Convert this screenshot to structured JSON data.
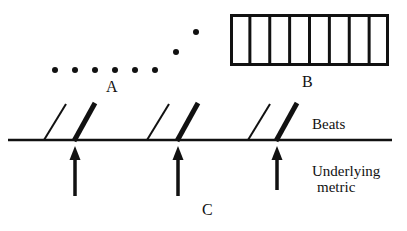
{
  "figure": {
    "width": 407,
    "height": 231,
    "background_color": "#ffffff",
    "ink_color": "#111111"
  },
  "labels": {
    "a": "A",
    "b": "B",
    "c": "C",
    "beats": "Beats",
    "underlying_metric_line1": "Underlying",
    "underlying_metric_line2": "metric"
  },
  "dot_row": {
    "name": "attack-point-dots",
    "count": 8,
    "radius": 3,
    "points": [
      {
        "x": 55,
        "y": 70
      },
      {
        "x": 75,
        "y": 70
      },
      {
        "x": 95,
        "y": 70
      },
      {
        "x": 115,
        "y": 70
      },
      {
        "x": 135,
        "y": 70
      },
      {
        "x": 155,
        "y": 70
      },
      {
        "x": 176,
        "y": 52
      },
      {
        "x": 196,
        "y": 32
      }
    ]
  },
  "grid_box": {
    "name": "eight-cell-grid",
    "x": 230,
    "y": 14,
    "width": 159,
    "height": 52,
    "cells": 8,
    "outer_stroke": 3,
    "inner_stroke": 3
  },
  "beat_line": {
    "name": "beats-baseline",
    "x1": 8,
    "x2": 392,
    "y": 140,
    "stroke": 2.5
  },
  "beat_slashes": [
    {
      "id": "slash-1",
      "weight": "thin",
      "x_bottom": 44,
      "x_top": 66,
      "y_bottom": 140,
      "y_top": 104,
      "stroke": 2
    },
    {
      "id": "slash-2",
      "weight": "thick",
      "x_bottom": 74,
      "x_top": 95,
      "y_bottom": 141,
      "y_top": 103,
      "stroke": 5
    },
    {
      "id": "slash-3",
      "weight": "thin",
      "x_bottom": 147,
      "x_top": 169,
      "y_bottom": 140,
      "y_top": 104,
      "stroke": 2
    },
    {
      "id": "slash-4",
      "weight": "thick",
      "x_bottom": 177,
      "x_top": 198,
      "y_bottom": 141,
      "y_top": 103,
      "stroke": 5
    },
    {
      "id": "slash-5",
      "weight": "thin",
      "x_bottom": 248,
      "x_top": 270,
      "y_bottom": 140,
      "y_top": 104,
      "stroke": 2
    },
    {
      "id": "slash-6",
      "weight": "thick",
      "x_bottom": 276,
      "x_top": 297,
      "y_bottom": 141,
      "y_top": 103,
      "stroke": 5
    }
  ],
  "metric_arrows": [
    {
      "id": "arrow-1",
      "x": 75,
      "y_tail": 196,
      "y_head": 146,
      "stroke": 3.5,
      "head_width": 11,
      "head_height": 14
    },
    {
      "id": "arrow-2",
      "x": 178,
      "y_tail": 196,
      "y_head": 146,
      "stroke": 3.5,
      "head_width": 11,
      "head_height": 14
    },
    {
      "id": "arrow-3",
      "x": 277,
      "y_tail": 190,
      "y_head": 146,
      "stroke": 3.5,
      "head_width": 11,
      "head_height": 14
    }
  ]
}
